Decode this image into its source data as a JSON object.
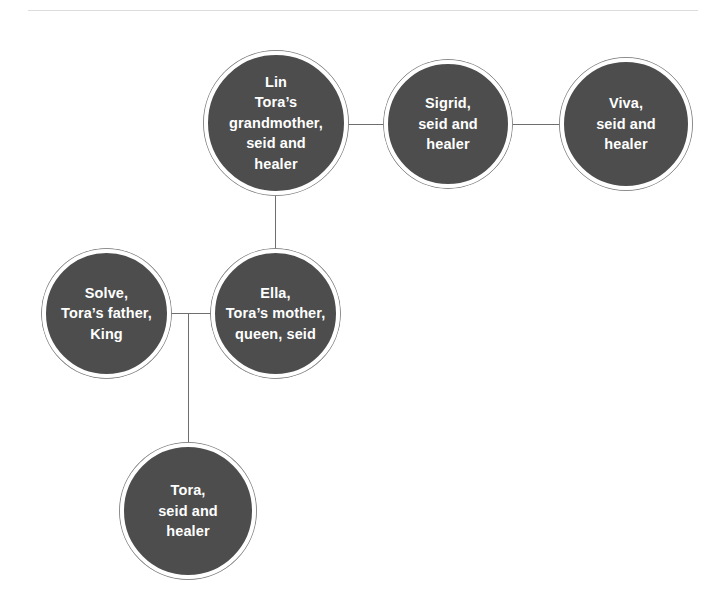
{
  "diagram": {
    "type": "family-tree",
    "title": "",
    "divider_color": "#dcdcdc",
    "node_fill_color": "#4d4d4d",
    "node_ring_color": "#8c8c8c",
    "node_text_color": "#ffffff",
    "connector_color": "#6e6e6e",
    "background_color": "#ffffff",
    "nodes": [
      {
        "id": "lin",
        "label": "Lin\nTora’s\ngrandmother,\nseid and\nhealer",
        "name": "Lin",
        "roles": "Tora’s grandmother, seid and healer"
      },
      {
        "id": "sigrid",
        "label": "Sigrid,\nseid and\nhealer",
        "name": "Sigrid",
        "roles": "seid and healer"
      },
      {
        "id": "viva",
        "label": "Viva,\nseid and\nhealer",
        "name": "Viva",
        "roles": "seid and healer"
      },
      {
        "id": "solve",
        "label": "Solve,\nTora’s father,\nKing",
        "name": "Solve",
        "roles": "Tora’s father, King"
      },
      {
        "id": "ella",
        "label": "Ella,\nTora’s mother,\nqueen, seid",
        "name": "Ella",
        "roles": "Tora’s mother, queen, seid"
      },
      {
        "id": "tora",
        "label": "Tora,\nseid and\nhealer",
        "name": "Tora",
        "roles": "seid and healer"
      }
    ],
    "connections": [
      {
        "id": "lin-sigrid",
        "from": "lin",
        "to": "sigrid",
        "orientation": "horizontal"
      },
      {
        "id": "sigrid-viva",
        "from": "sigrid",
        "to": "viva",
        "orientation": "horizontal"
      },
      {
        "id": "lin-ella",
        "from": "lin",
        "to": "ella",
        "orientation": "vertical"
      },
      {
        "id": "solve-ella",
        "from": "solve",
        "to": "ella",
        "orientation": "horizontal"
      },
      {
        "id": "ella-tora",
        "from": "ella",
        "to": "tora",
        "orientation": "vertical"
      }
    ]
  }
}
